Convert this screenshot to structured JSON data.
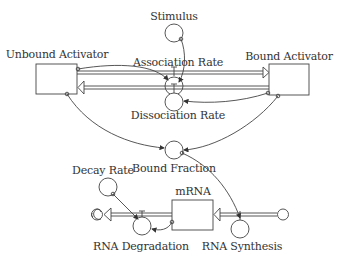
{
  "diagram": {
    "type": "stock-and-flow",
    "stocks": [
      {
        "id": "unbound",
        "label": "Unbound Activator"
      },
      {
        "id": "bound",
        "label": "Bound Activator"
      },
      {
        "id": "mrna",
        "label": "mRNA"
      }
    ],
    "flows": [
      {
        "id": "association",
        "label": "Association Rate"
      },
      {
        "id": "dissociation",
        "label": "Dissociation Rate"
      },
      {
        "id": "degradation",
        "label": "RNA Degradation"
      },
      {
        "id": "synthesis",
        "label": "RNA Synthesis"
      }
    ],
    "auxiliaries": [
      {
        "id": "stimulus",
        "label": "Stimulus"
      },
      {
        "id": "bound_fraction",
        "label": "Bound Fraction"
      },
      {
        "id": "decay_rate",
        "label": "Decay Rate"
      }
    ],
    "colors": {
      "line": "#444444",
      "pipe": "#555555",
      "background": "#ffffff"
    }
  }
}
